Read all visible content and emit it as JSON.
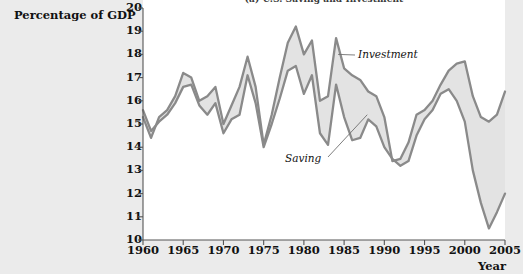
{
  "figure": {
    "title": "(a) U.S. Saving and Investment",
    "ylabel": "Percentage of GDP",
    "xlabel": "Year",
    "annotations": [
      {
        "name": "investment-label",
        "text": "Investment",
        "x": 358,
        "y": 48
      },
      {
        "name": "saving-label",
        "text": "Saving",
        "x": 285,
        "y": 152
      }
    ],
    "colors": {
      "line": "#8a8a8a",
      "fill": "#e3e3e3",
      "panel": "#ffffff",
      "page_background": "#ebebeb",
      "text": "#111111"
    }
  },
  "chart_data": {
    "type": "line",
    "title": "(a) U.S. Saving and Investment",
    "xlabel": "Year",
    "ylabel": "Percentage of GDP",
    "xlim": [
      1960,
      2005
    ],
    "ylim": [
      10,
      20
    ],
    "xticks": [
      1960,
      1965,
      1970,
      1975,
      1980,
      1985,
      1990,
      1995,
      2000,
      2005
    ],
    "yticks": [
      10,
      11,
      12,
      13,
      14,
      15,
      16,
      17,
      18,
      19,
      20
    ],
    "grid": false,
    "legend": "inline-annotations",
    "x": [
      1960,
      1961,
      1962,
      1963,
      1964,
      1965,
      1966,
      1967,
      1968,
      1969,
      1970,
      1971,
      1972,
      1973,
      1974,
      1975,
      1976,
      1977,
      1978,
      1979,
      1980,
      1981,
      1982,
      1983,
      1984,
      1985,
      1986,
      1987,
      1988,
      1989,
      1990,
      1991,
      1992,
      1993,
      1994,
      1995,
      1996,
      1997,
      1998,
      1999,
      2000,
      2001,
      2002,
      2003,
      2004,
      2005
    ],
    "series": [
      {
        "name": "Saving",
        "values": [
          15.6,
          14.7,
          15.1,
          15.4,
          15.9,
          16.6,
          16.7,
          15.8,
          15.4,
          15.9,
          14.6,
          15.2,
          15.4,
          17.1,
          15.9,
          14.0,
          15.0,
          16.1,
          17.3,
          17.5,
          16.3,
          17.1,
          14.6,
          14.1,
          16.7,
          15.3,
          14.3,
          14.4,
          15.2,
          14.9,
          14.0,
          13.5,
          13.2,
          13.4,
          14.5,
          15.2,
          15.6,
          16.3,
          16.5,
          16.0,
          15.1,
          13.0,
          11.6,
          10.5,
          11.2,
          12.0
        ]
      },
      {
        "name": "Investment",
        "values": [
          15.3,
          14.4,
          15.3,
          15.6,
          16.2,
          17.2,
          17.0,
          16.0,
          16.2,
          16.6,
          15.0,
          15.8,
          16.6,
          17.9,
          16.6,
          14.1,
          15.4,
          17.0,
          18.5,
          19.2,
          18.0,
          18.6,
          16.0,
          16.2,
          18.7,
          17.4,
          17.1,
          16.9,
          16.4,
          16.2,
          15.3,
          13.4,
          13.5,
          14.2,
          15.4,
          15.6,
          16.0,
          16.7,
          17.3,
          17.6,
          17.7,
          16.2,
          15.3,
          15.1,
          15.4,
          16.4
        ]
      }
    ]
  }
}
